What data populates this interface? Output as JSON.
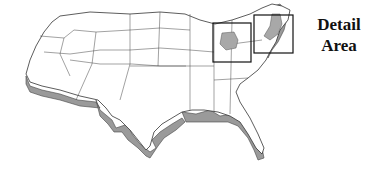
{
  "map": {
    "subject": "Contiguous United States",
    "style": "3D extruded outline with state borders",
    "highlighted_regions": [
      {
        "name": "central-midwest-highlight",
        "fill": "#a8a8a8"
      },
      {
        "name": "northeast-highlight",
        "fill": "#a8a8a8"
      }
    ],
    "detail_boxes": [
      {
        "name": "detail-box-midwest",
        "x": 213,
        "y": 23,
        "w": 38,
        "h": 39
      },
      {
        "name": "detail-box-northeast",
        "x": 254,
        "y": 15,
        "w": 39,
        "h": 38
      }
    ]
  },
  "legend": {
    "line1": "Detail",
    "line2": "Area"
  },
  "colors": {
    "land": "#ffffff",
    "border": "#333333",
    "extrusion": "#9a9a9a",
    "highlight": "#a8a8a8",
    "box": "#111111"
  }
}
